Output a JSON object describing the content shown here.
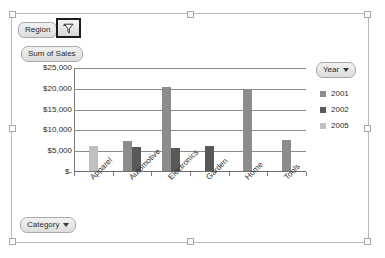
{
  "pivot": {
    "region_field_label": "Region",
    "region_filter_icon": "filter-funnel-icon",
    "value_field_label": "Sum of Sales",
    "category_field_label": "Category",
    "category_caret_icon": "chevron-down-icon",
    "legend_field_label": "Year",
    "legend_caret_icon": "chevron-down-icon"
  },
  "chart_data": {
    "type": "bar",
    "title": "Sum of Sales",
    "xlabel": "Category",
    "ylabel": "",
    "categories": [
      "Apparel",
      "Automotive",
      "Electronics",
      "Garden",
      "Home",
      "Tools"
    ],
    "series": [
      {
        "name": "2001",
        "color": "#8c8c8c",
        "values": [
          null,
          7200,
          20300,
          null,
          19400,
          7400
        ]
      },
      {
        "name": "2002",
        "color": "#595959",
        "values": [
          null,
          5700,
          5500,
          6000,
          null,
          null
        ]
      },
      {
        "name": "2005",
        "color": "#bfbfbf",
        "values": [
          6100,
          null,
          null,
          null,
          null,
          null
        ]
      }
    ],
    "ylim": [
      0,
      25000
    ],
    "ytick_values": [
      0,
      5000,
      10000,
      15000,
      20000,
      25000
    ],
    "ytick_labels": [
      "$-",
      "$5,000",
      "$10,000",
      "$15,000",
      "$20,000",
      "$25,000"
    ],
    "grid": true,
    "legend_position": "right",
    "legend_entries": [
      "2001",
      "2002",
      "2005"
    ]
  }
}
